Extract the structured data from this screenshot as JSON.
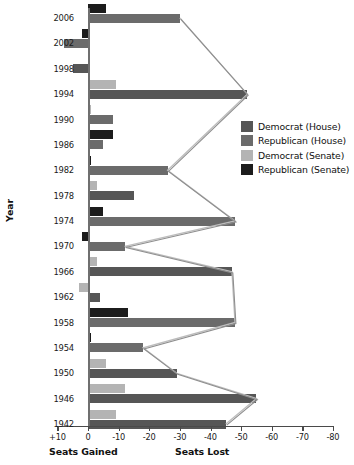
{
  "chart_data": {
    "type": "bar",
    "orientation": "horizontal",
    "title": "",
    "xlabel_left": "Seats Gained",
    "xlabel_right": "Seats Lost",
    "ylabel": "Year",
    "xlim": [
      10,
      -80
    ],
    "xticks": [
      10,
      0,
      -10,
      -20,
      -30,
      -40,
      -50,
      -60,
      -70,
      -80
    ],
    "xtick_labels": [
      "+10",
      "0",
      "-10",
      "-20",
      "-30",
      "-40",
      "-50",
      "-60",
      "-70",
      "-80"
    ],
    "yticks": [
      2006,
      2002,
      1998,
      1994,
      1990,
      1986,
      1982,
      1978,
      1974,
      1970,
      1966,
      1962,
      1958,
      1954,
      1950,
      1946,
      1942
    ],
    "grid": false,
    "legend_position": "right",
    "series": [
      {
        "name": "Democrat (House)",
        "key": "dem_house",
        "color": "#565656"
      },
      {
        "name": "Republican (House)",
        "key": "rep_house",
        "color": "#6b6b6b"
      },
      {
        "name": "Democrat (Senate)",
        "key": "dem_senate",
        "color": "#b4b4b4"
      },
      {
        "name": "Republican (Senate)",
        "key": "rep_senate",
        "color": "#1c1c1c"
      }
    ],
    "bars": [
      {
        "year": 2006,
        "series": "rep_senate",
        "value": -6
      },
      {
        "year": 2006,
        "series": "rep_house",
        "value": -30
      },
      {
        "year": 2002,
        "series": "rep_senate",
        "value": 2
      },
      {
        "year": 2002,
        "series": "rep_house",
        "value": 8
      },
      {
        "year": 1998,
        "series": "dem_house",
        "value": 5
      },
      {
        "year": 1994,
        "series": "dem_senate",
        "value": -9
      },
      {
        "year": 1994,
        "series": "dem_house",
        "value": -52
      },
      {
        "year": 1990,
        "series": "dem_senate",
        "value": -1
      },
      {
        "year": 1990,
        "series": "rep_house",
        "value": -8
      },
      {
        "year": 1986,
        "series": "rep_senate",
        "value": -8
      },
      {
        "year": 1986,
        "series": "rep_house",
        "value": -5
      },
      {
        "year": 1982,
        "series": "rep_senate",
        "value": -1
      },
      {
        "year": 1982,
        "series": "rep_house",
        "value": -26
      },
      {
        "year": 1978,
        "series": "dem_senate",
        "value": -3
      },
      {
        "year": 1978,
        "series": "dem_house",
        "value": -15
      },
      {
        "year": 1974,
        "series": "rep_senate",
        "value": -5
      },
      {
        "year": 1974,
        "series": "rep_house",
        "value": -48
      },
      {
        "year": 1970,
        "series": "rep_senate",
        "value": 2
      },
      {
        "year": 1970,
        "series": "rep_house",
        "value": -12
      },
      {
        "year": 1966,
        "series": "dem_senate",
        "value": -3
      },
      {
        "year": 1966,
        "series": "dem_house",
        "value": -47
      },
      {
        "year": 1962,
        "series": "dem_senate",
        "value": 3
      },
      {
        "year": 1962,
        "series": "dem_house",
        "value": -4
      },
      {
        "year": 1958,
        "series": "rep_senate",
        "value": -13
      },
      {
        "year": 1958,
        "series": "rep_house",
        "value": -48
      },
      {
        "year": 1954,
        "series": "rep_senate",
        "value": -1
      },
      {
        "year": 1954,
        "series": "rep_house",
        "value": -18
      },
      {
        "year": 1950,
        "series": "dem_senate",
        "value": -6
      },
      {
        "year": 1950,
        "series": "dem_house",
        "value": -29
      },
      {
        "year": 1946,
        "series": "dem_senate",
        "value": -12
      },
      {
        "year": 1946,
        "series": "dem_house",
        "value": -55
      },
      {
        "year": 1942,
        "series": "dem_senate",
        "value": -9
      },
      {
        "year": 1942,
        "series": "dem_house",
        "value": -45
      }
    ],
    "connector_series": [
      {
        "name": "house-trend",
        "color": "#bdbdbd",
        "points": [
          [
            -30,
            2006
          ],
          [
            -52,
            1994
          ],
          [
            -26,
            1982
          ],
          [
            -48,
            1974
          ],
          [
            -12,
            1970
          ],
          [
            -47,
            1966
          ],
          [
            -48,
            1958
          ],
          [
            -18,
            1954
          ],
          [
            -29,
            1950
          ],
          [
            -55,
            1946
          ],
          [
            -45,
            1942
          ]
        ]
      },
      {
        "name": "house-trend-shadow",
        "color": "#8e8e8e",
        "points": [
          [
            -30,
            2006
          ],
          [
            -52,
            1994
          ],
          [
            -26,
            1982
          ],
          [
            -48,
            1974
          ],
          [
            -12,
            1970
          ],
          [
            -47,
            1966
          ],
          [
            -48,
            1958
          ],
          [
            -18,
            1954
          ],
          [
            -29,
            1950
          ],
          [
            -55,
            1946
          ],
          [
            -45,
            1942
          ]
        ]
      }
    ]
  },
  "legend": {
    "items": [
      {
        "label": "Democrat (House)",
        "color": "#565656"
      },
      {
        "label": "Republican (House)",
        "color": "#6b6b6b"
      },
      {
        "label": "Democrat (Senate)",
        "color": "#b4b4b4"
      },
      {
        "label": "Republican (Senate)",
        "color": "#1c1c1c"
      }
    ]
  }
}
